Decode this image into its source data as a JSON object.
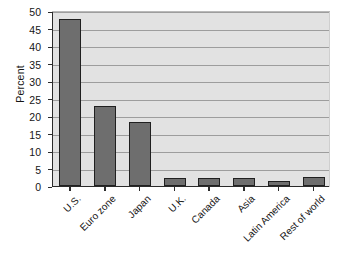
{
  "chart_data": {
    "type": "bar",
    "title": "",
    "subtitle": "",
    "xlabel": "",
    "ylabel": "Percent",
    "categories": [
      "U.S.",
      "Euro zone",
      "Japan",
      "U.K.",
      "Canada",
      "Asia",
      "Latin America",
      "Rest of world"
    ],
    "values": [
      47.8,
      23.0,
      18.4,
      2.3,
      2.2,
      2.2,
      1.4,
      2.6
    ],
    "ylim": [
      0,
      50
    ],
    "ytick_values": [
      0,
      5,
      10,
      15,
      20,
      25,
      30,
      35,
      40,
      45,
      50
    ],
    "ytick_labels": [
      "0",
      "5",
      "10",
      "15",
      "20",
      "25",
      "30",
      "35",
      "40",
      "45",
      "50"
    ],
    "grid": true,
    "grid_axis": "y",
    "legend": false,
    "legend_position": "none",
    "bar_color": "#6e6e6e",
    "bar_edge_color": "#202020",
    "plot_background": "#e2e2e2",
    "xtick_rotation": -45
  },
  "edge_caption_fragments": [
    "",
    "",
    "",
    "",
    "",
    ""
  ]
}
